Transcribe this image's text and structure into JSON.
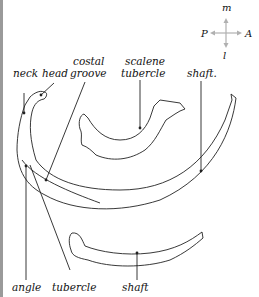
{
  "figure": {
    "compass": {
      "up": "m",
      "down": "l",
      "left": "P",
      "right": "A",
      "arrow_color": "#b0b0b0"
    },
    "labels": {
      "neck": "neck",
      "head": "head",
      "costal_groove_1": "costal",
      "costal_groove_2": "groove",
      "scalene_1": "scalene",
      "scalene_2": "tubercle",
      "shaft_top": "shaft.",
      "angle": "angle",
      "tubercle": "tubercle",
      "shaft_bottom": "shaft"
    },
    "line_color": "#222222"
  }
}
